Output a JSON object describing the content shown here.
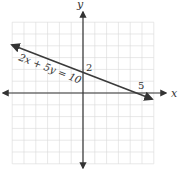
{
  "chart_data": {
    "type": "line",
    "title": "",
    "xlabel": "x",
    "ylabel": "y",
    "xlim": [
      -6,
      6
    ],
    "ylim": [
      -6,
      6
    ],
    "grid": true,
    "series": [
      {
        "name": "2x + 5y = 10",
        "equation": "2x + 5y = 10",
        "slope": -0.4,
        "y_intercept": 2,
        "x_intercept": 5,
        "points": [
          [
            -6,
            4.4
          ],
          [
            0,
            2
          ],
          [
            5,
            0
          ],
          [
            6,
            -0.4
          ]
        ]
      }
    ],
    "annotations": [
      {
        "text": "2",
        "at": [
          0,
          2
        ],
        "meaning": "y-intercept"
      },
      {
        "text": "5",
        "at": [
          5,
          0
        ],
        "meaning": "x-intercept"
      },
      {
        "text": "2x + 5y = 10",
        "meaning": "line label"
      }
    ]
  },
  "labels": {
    "x_axis": "x",
    "y_axis": "y",
    "equation": "2x + 5y = 10",
    "y_intercept": "2",
    "x_intercept": "5"
  },
  "colors": {
    "grid": "#d8d8d8",
    "axis": "#333333",
    "line": "#3a3a3a"
  }
}
